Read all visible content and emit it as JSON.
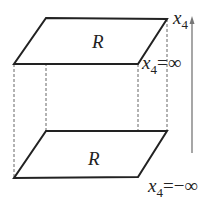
{
  "diagram": {
    "top_plane": {
      "label": "R",
      "boundary_label_var": "x",
      "boundary_label_sub": "4",
      "boundary_label_rest": "=∞"
    },
    "bottom_plane": {
      "label": "R",
      "boundary_label_var": "x",
      "boundary_label_sub": "4",
      "boundary_label_rest": "=−∞"
    },
    "axis": {
      "label_var": "x",
      "label_sub": "4"
    },
    "colors": {
      "stroke": "#222222",
      "dashed": "#555555",
      "axis": "#777777"
    }
  }
}
